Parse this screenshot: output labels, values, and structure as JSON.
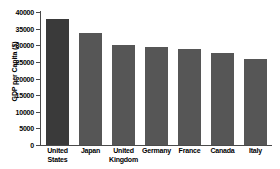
{
  "chart_data": {
    "type": "bar",
    "title": "",
    "xlabel": "",
    "ylabel": "GDP per Capita ($)",
    "categories": [
      "United States",
      "Japan",
      "United Kingdom",
      "Germany",
      "France",
      "Canada",
      "Italy"
    ],
    "values": [
      37800,
      33800,
      30200,
      29400,
      28800,
      27700,
      25900
    ],
    "ylim": [
      0,
      40000
    ],
    "ytick_labels": [
      "40000",
      "35000",
      "30000",
      "25000",
      "20000",
      "15000",
      "10000",
      "5000",
      "0"
    ],
    "ytick_values": [
      40000,
      35000,
      30000,
      25000,
      20000,
      15000,
      10000,
      5000,
      0
    ],
    "grid": false,
    "legend": "none",
    "bar_color": "#565656",
    "highlight_color": "#3a3a3a",
    "highlight_index": 0,
    "axis_color": "#4a4a4a",
    "background": "#ffffff"
  }
}
